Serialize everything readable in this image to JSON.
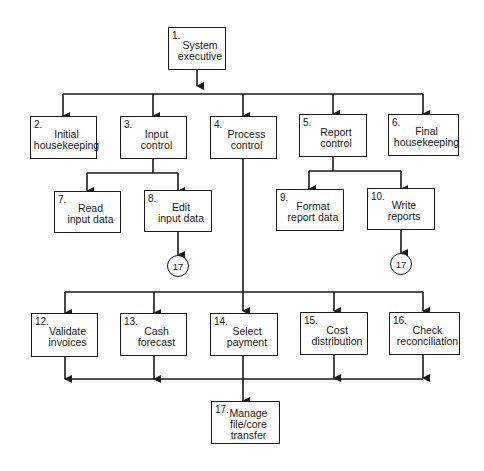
{
  "diagram": {
    "type": "hierarchy-chart",
    "nodes": [
      {
        "id": "1",
        "num": "1.",
        "label": "System\nexecutive"
      },
      {
        "id": "2",
        "num": "2.",
        "label": "Initial\nhousekeeping"
      },
      {
        "id": "3",
        "num": "3.",
        "label": "Input\ncontrol"
      },
      {
        "id": "4",
        "num": "4.",
        "label": "Process\ncontrol"
      },
      {
        "id": "5",
        "num": "5.",
        "label": "Report\ncontrol"
      },
      {
        "id": "6",
        "num": "6.",
        "label": "Final\nhousekeeping"
      },
      {
        "id": "7",
        "num": "7.",
        "label": "Read\ninput data"
      },
      {
        "id": "8",
        "num": "8.",
        "label": "Edit\ninput data"
      },
      {
        "id": "9",
        "num": "9.",
        "label": "Format\nreport data"
      },
      {
        "id": "10",
        "num": "10.",
        "label": "Write\nreports"
      },
      {
        "id": "12",
        "num": "12.",
        "label": "Validate\ninvoices"
      },
      {
        "id": "13",
        "num": "13.",
        "label": "Cash\nforecast"
      },
      {
        "id": "14",
        "num": "14.",
        "label": "Select\npayment"
      },
      {
        "id": "15",
        "num": "15.",
        "label": "Cost\ndistribution"
      },
      {
        "id": "16",
        "num": "16.",
        "label": "Check\nreconciliation"
      },
      {
        "id": "17",
        "num": "17.",
        "label": "Manage\nfile/core\ntransfer"
      }
    ],
    "connectors": [
      {
        "from": "8",
        "label": "17"
      },
      {
        "from": "10",
        "label": "17"
      }
    ],
    "edges": [
      [
        "1",
        "2"
      ],
      [
        "1",
        "3"
      ],
      [
        "1",
        "4"
      ],
      [
        "1",
        "5"
      ],
      [
        "1",
        "6"
      ],
      [
        "3",
        "7"
      ],
      [
        "3",
        "8"
      ],
      [
        "5",
        "9"
      ],
      [
        "5",
        "10"
      ],
      [
        "4",
        "12"
      ],
      [
        "4",
        "13"
      ],
      [
        "4",
        "14"
      ],
      [
        "4",
        "15"
      ],
      [
        "4",
        "16"
      ],
      [
        "12",
        "17"
      ],
      [
        "13",
        "17"
      ],
      [
        "14",
        "17"
      ],
      [
        "15",
        "17"
      ],
      [
        "16",
        "17"
      ]
    ]
  }
}
